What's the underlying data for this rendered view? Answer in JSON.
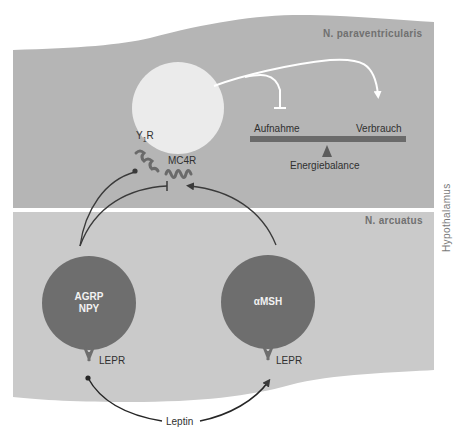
{
  "regions": {
    "upper": {
      "label": "N. paraventricularis",
      "color": "#b4b4b4"
    },
    "lower": {
      "label": "N. arcuatus",
      "color": "#c9c9c9"
    },
    "side_label": "Hypothalamus"
  },
  "pvn_cell": {
    "color": "#ebebeb",
    "receptors": [
      {
        "label_main": "Y",
        "label_sub": "1",
        "label_tail": "R"
      },
      {
        "label": "MC4R"
      }
    ]
  },
  "balance": {
    "left_label": "Aufnahme",
    "right_label": "Verbrauch",
    "caption": "Energiebalance",
    "bar_color": "#6a6a6a"
  },
  "arcuate_cells": [
    {
      "line1": "AGRP",
      "line2": "NPY",
      "receptor": "LEPR",
      "color": "#6e6e6e"
    },
    {
      "line1": "αMSH",
      "receptor": "LEPR",
      "color": "#6e6e6e"
    }
  ],
  "signal": {
    "label": "Leptin"
  }
}
